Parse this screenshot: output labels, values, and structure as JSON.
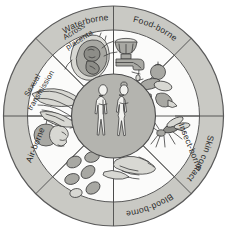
{
  "diagram": {
    "center": {
      "label": "human-figures",
      "description": "Male and female human body silhouettes",
      "fill_color": "#b4b4af"
    },
    "ring": {
      "fill_color": "#c9c9c4",
      "segment_fill_color": "#fbfbfa",
      "outline_color": "#5a5a5a"
    },
    "segments": [
      {
        "id": "waterborne",
        "label": "Waterborne",
        "icon": "faucet-tap-icon",
        "angle_start": -68,
        "angle_end": -22,
        "label_lines": [
          "Waterborne"
        ]
      },
      {
        "id": "food-borne",
        "label": "Food-borne",
        "icon": "vegetables-food-icon",
        "angle_start": -22,
        "angle_end": 24,
        "label_lines": [
          "Food-borne"
        ]
      },
      {
        "id": "insect-borne",
        "label": "Insect-borne",
        "icon": "mosquito-icon",
        "angle_start": 24,
        "angle_end": 70,
        "label_lines": [
          "Insect-borne"
        ]
      },
      {
        "id": "skin-contact",
        "label": "Skin contact",
        "icon": "handshake-icon",
        "angle_start": 70,
        "angle_end": 113,
        "label_lines": [
          "Skin contact"
        ]
      },
      {
        "id": "blood-borne",
        "label": "Blood-borne",
        "icon": "blood-cells-icon",
        "angle_start": 113,
        "angle_end": 157,
        "label_lines": [
          "Blood-borne"
        ]
      },
      {
        "id": "air-borne",
        "label": "Air-borne",
        "icon": "sneezing-head-icon",
        "angle_start": 157,
        "angle_end": 200,
        "label_lines": [
          "Air-borne"
        ]
      },
      {
        "id": "sexual-transmission",
        "label": "Sexual transmission",
        "icon": "genital-anatomy-icon",
        "angle_start": 200,
        "angle_end": 248,
        "label_lines": [
          "Sexual",
          "transmission"
        ]
      },
      {
        "id": "across-placenta",
        "label": "Across placenta",
        "icon": "fetus-in-womb-icon",
        "angle_start": 248,
        "angle_end": 292,
        "label_lines": [
          "Across",
          "placenta"
        ]
      }
    ]
  }
}
